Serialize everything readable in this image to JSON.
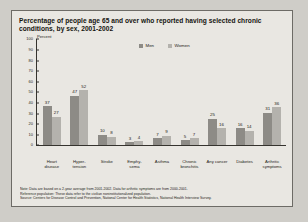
{
  "chart_data": {
    "type": "bar",
    "title": "Percentage of people age 65 and over who reported having selected chronic conditions, by sex, 2001-2002",
    "ylabel": "Percent",
    "xlabel": "",
    "ylim": [
      0,
      100
    ],
    "yticks": [
      0,
      10,
      20,
      30,
      40,
      50,
      60,
      70,
      80,
      90,
      100
    ],
    "grid": false,
    "legend_position": "top-center",
    "categories": [
      "Heart disease",
      "Hyper- tension",
      "Stroke",
      "Emphy- sema",
      "Asthma",
      "Chronic bronchitis",
      "Any cancer",
      "Diabetes",
      "Arthritic symptoms"
    ],
    "series": [
      {
        "name": "Men",
        "color": "#8d8b86",
        "values": [
          37,
          47,
          10,
          3,
          7,
          5,
          25,
          16,
          31
        ]
      },
      {
        "name": "Women",
        "color": "#b4b2ad",
        "values": [
          27,
          52,
          8,
          4,
          9,
          7,
          16,
          14,
          36
        ]
      }
    ]
  },
  "notes": [
    "Note: Data are based on a 2-year average from 2001-2002. Data for arthritic symptoms are from 2000-2001.",
    "Reference population: These data refer to the civilian noninstitutionalized population.",
    "Source: Centers for Disease Control and Prevention, National Center for Health Statistics, National Health Interview Survey."
  ]
}
